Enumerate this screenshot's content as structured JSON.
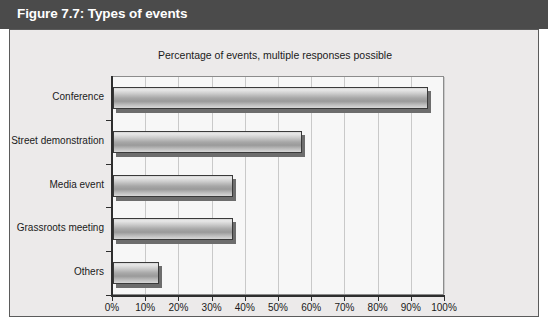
{
  "figure": {
    "caption_label": "Figure 7.7:",
    "caption_title": "Types of events",
    "caption_full": "Figure 7.7: Types of events",
    "title_bar_color": "#4b4b4b",
    "title_text_color": "#ffffff",
    "frame_background": "#eceaea",
    "plot_background": "#f7f7f7",
    "gridline_color": "#c9c9c9",
    "axis_color": "#2e2e2e",
    "bar_outline_color": "#3a3a3a",
    "bar_shadow_color": "#6d6d6d"
  },
  "chart_data": {
    "type": "bar",
    "orientation": "horizontal",
    "title": "Percentage of events, multiple responses possible",
    "subtitle": "",
    "categories": [
      "Conference",
      "Street demonstration",
      "Media event",
      "Grassroots meeting",
      "Others"
    ],
    "values": [
      95,
      57,
      36,
      36,
      14
    ],
    "value_labels": [
      "95%",
      "57%",
      "36%",
      "36%",
      "14%"
    ],
    "xlabel": "",
    "ylabel": "",
    "xlim": [
      0,
      100
    ],
    "xtick_values": [
      0,
      10,
      20,
      30,
      40,
      50,
      60,
      70,
      80,
      90,
      100
    ],
    "xtick_labels": [
      "0%",
      "10%",
      "20%",
      "30%",
      "40%",
      "50%",
      "60%",
      "70%",
      "80%",
      "90%",
      "100%"
    ],
    "grid": "vertical",
    "legend": null,
    "series": [
      {
        "name": "Percentage of events",
        "values": [
          95,
          57,
          36,
          36,
          14
        ]
      }
    ]
  }
}
